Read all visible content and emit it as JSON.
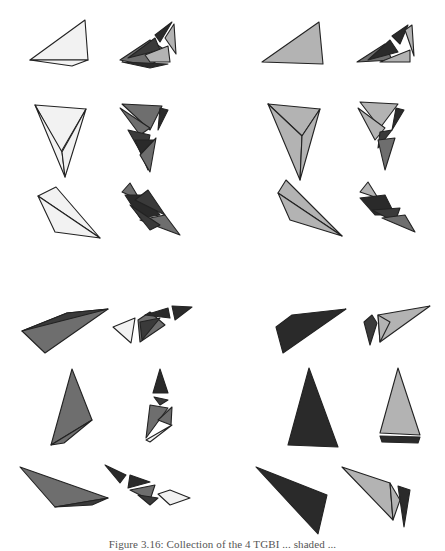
{
  "caption": "Figure 3.16: Collection of the 4 TGBI ... shaded ...",
  "colors": {
    "white_fill": "#f2f2f2",
    "light_gray": "#b3b3b3",
    "mid_gray": "#6e6e6e",
    "dark_gray": "#3a3a3a",
    "darkest": "#2a2a2a",
    "stroke": "#222222"
  },
  "panels": [
    {
      "name": "top-left-light",
      "label": "upper-left panel: white complete shapes with dark fragments"
    },
    {
      "name": "top-right-gray",
      "label": "upper-right panel: gray complete shapes with dark fragments"
    },
    {
      "name": "bottom-left-mid",
      "label": "lower-left panel: mid-gray complete shapes with fragments"
    },
    {
      "name": "bottom-right-dark",
      "label": "lower-right panel: dark complete shapes with light fragments"
    }
  ],
  "shapes": [
    {
      "id": "s1",
      "fill": "white_fill",
      "pts": "30,60 85,20 88,60"
    },
    {
      "id": "s1b",
      "fill": "white_fill",
      "pts": "30,60 88,60 72,66"
    },
    {
      "id": "f1a",
      "fill": "mid_gray",
      "pts": "120,60 150,40 168,52 150,66"
    },
    {
      "id": "f1b",
      "fill": "dark_gray",
      "pts": "128,58 155,38 160,50"
    },
    {
      "id": "f1c",
      "fill": "light_gray",
      "pts": "145,55 168,46 170,62 150,62"
    },
    {
      "id": "f1d",
      "fill": "darkest",
      "pts": "155,35 172,22 160,42"
    },
    {
      "id": "f1e",
      "fill": "light_gray",
      "pts": "165,38 174,24 176,54"
    },
    {
      "id": "f1f",
      "fill": "darkest",
      "pts": "122,62 168,64 150,68"
    },
    {
      "id": "s2",
      "fill": "light_gray",
      "pts": "262,62 319,22 323,64"
    },
    {
      "id": "f2a",
      "fill": "mid_gray",
      "pts": "357,62 385,44 392,60"
    },
    {
      "id": "f2b",
      "fill": "darkest",
      "pts": "368,60 390,40 398,52"
    },
    {
      "id": "f2c",
      "fill": "darkest",
      "pts": "392,36 408,25 400,44"
    },
    {
      "id": "f2d",
      "fill": "light_gray",
      "pts": "405,30 412,25 414,56"
    },
    {
      "id": "f2e",
      "fill": "light_gray",
      "pts": "380,62 410,50 410,62"
    },
    {
      "id": "s3",
      "fill": "white_fill",
      "pts": "35,105 86,109 61,152"
    },
    {
      "id": "s3b",
      "fill": "white_fill",
      "pts": "35,105 62,152 65,177"
    },
    {
      "id": "s3c",
      "fill": "white_fill",
      "pts": "62,152 86,109 65,177"
    },
    {
      "id": "f3a",
      "fill": "mid_gray",
      "pts": "122,104 162,106 150,130"
    },
    {
      "id": "f3b",
      "fill": "mid_gray",
      "pts": "120,108 140,135 150,128"
    },
    {
      "id": "f3c",
      "fill": "darkest",
      "pts": "160,108 168,110 158,130"
    },
    {
      "id": "f3d",
      "fill": "dark_gray",
      "pts": "128,130 150,135 145,160"
    },
    {
      "id": "f3e",
      "fill": "darkest",
      "pts": "135,140 155,140 148,170"
    },
    {
      "id": "f3f",
      "fill": "mid_gray",
      "pts": "140,155 156,138 150,172"
    },
    {
      "id": "s4",
      "fill": "light_gray",
      "pts": "268,104 320,109 302,136"
    },
    {
      "id": "s4b",
      "fill": "light_gray",
      "pts": "268,104 302,136 300,180"
    },
    {
      "id": "s4c",
      "fill": "light_gray",
      "pts": "302,136 320,109 300,180"
    },
    {
      "id": "f4a",
      "fill": "light_gray",
      "pts": "360,102 398,104 380,128"
    },
    {
      "id": "f4b",
      "fill": "light_gray",
      "pts": "358,108 375,140 385,128"
    },
    {
      "id": "f4c",
      "fill": "darkest",
      "pts": "396,108 404,110 392,130"
    },
    {
      "id": "f4d",
      "fill": "dark_gray",
      "pts": "380,132 392,130 378,148"
    },
    {
      "id": "f4e",
      "fill": "mid_gray",
      "pts": "378,140 395,138 385,170"
    },
    {
      "id": "s5",
      "fill": "white_fill",
      "pts": "38,196 56,187 100,238"
    },
    {
      "id": "s5b",
      "fill": "white_fill",
      "pts": "38,196 55,232 100,238"
    },
    {
      "id": "f5a",
      "fill": "mid_gray",
      "pts": "122,192 130,183 140,200"
    },
    {
      "id": "f5b",
      "fill": "darkest",
      "pts": "125,195 145,195 160,215 140,218"
    },
    {
      "id": "f5c",
      "fill": "dark_gray",
      "pts": "135,200 148,190 165,215"
    },
    {
      "id": "f5d",
      "fill": "mid_gray",
      "pts": "140,220 165,215 180,235"
    },
    {
      "id": "f5e",
      "fill": "dark_gray",
      "pts": "130,205 160,225 150,230"
    },
    {
      "id": "s6",
      "fill": "light_gray",
      "pts": "278,193 286,180 342,236"
    },
    {
      "id": "s6b",
      "fill": "light_gray",
      "pts": "278,193 290,220 342,236"
    },
    {
      "id": "f6a",
      "fill": "light_gray",
      "pts": "360,192 368,182 378,198"
    },
    {
      "id": "f6b",
      "fill": "darkest",
      "pts": "360,198 385,195 395,215 375,215"
    },
    {
      "id": "f6c",
      "fill": "dark_gray",
      "pts": "372,210 400,208 395,222"
    },
    {
      "id": "f6d",
      "fill": "mid_gray",
      "pts": "382,218 405,215 415,232"
    },
    {
      "id": "s7",
      "fill": "mid_gray",
      "pts": "22,331 67,313 108,309 45,353"
    },
    {
      "id": "s7b",
      "fill": "dark_gray",
      "pts": "22,331 67,313 108,309"
    },
    {
      "id": "f7a",
      "fill": "white_fill",
      "pts": "113,327 135,318 131,343"
    },
    {
      "id": "f7b",
      "fill": "mid_gray",
      "pts": "138,320 150,312 165,325 140,342"
    },
    {
      "id": "f7c",
      "fill": "darkest",
      "pts": "145,315 168,308 170,318"
    },
    {
      "id": "f7d",
      "fill": "darkest",
      "pts": "172,306 192,307 175,320"
    },
    {
      "id": "f7e",
      "fill": "dark_gray",
      "pts": "140,322 160,318 142,340"
    },
    {
      "id": "s8",
      "fill": "darkest",
      "pts": "276,327 292,315 346,309 283,353"
    },
    {
      "id": "f8a",
      "fill": "dark_gray",
      "pts": "364,322 372,315 377,323 370,345"
    },
    {
      "id": "f8b",
      "fill": "light_gray",
      "pts": "378,315 430,306 380,342"
    },
    {
      "id": "f8c",
      "fill": "light_gray",
      "pts": "378,315 390,322 380,342"
    },
    {
      "id": "s9",
      "fill": "mid_gray",
      "pts": "72,369 92,420 51,445"
    },
    {
      "id": "s9b",
      "fill": "mid_gray",
      "pts": "51,445 92,420 64,443"
    },
    {
      "id": "f9a",
      "fill": "darkest",
      "pts": "160,369 168,393 153,393"
    },
    {
      "id": "f9b",
      "fill": "dark_gray",
      "pts": "154,397 168,400 160,405"
    },
    {
      "id": "f9c",
      "fill": "mid_gray",
      "pts": "150,405 168,408 146,438"
    },
    {
      "id": "f9d",
      "fill": "mid_gray",
      "pts": "158,420 172,407 171,425"
    },
    {
      "id": "f9e",
      "fill": "white_fill",
      "pts": "146,440 172,425 150,442"
    },
    {
      "id": "s10",
      "fill": "darkest",
      "pts": "309,368 338,447 288,445"
    },
    {
      "id": "f10a",
      "fill": "light_gray",
      "pts": "398,368 420,435 380,433"
    },
    {
      "id": "f10b",
      "fill": "darkest",
      "pts": "380,436 420,437 418,443 382,442"
    },
    {
      "id": "s11",
      "fill": "mid_gray",
      "pts": "20,467 108,498 55,507"
    },
    {
      "id": "s11b",
      "fill": "dark_gray",
      "pts": "55,507 108,498 92,505"
    },
    {
      "id": "f11a",
      "fill": "darkest",
      "pts": "105,465 126,475 120,483"
    },
    {
      "id": "f11b",
      "fill": "darkest",
      "pts": "130,475 150,482 128,488"
    },
    {
      "id": "f11c",
      "fill": "mid_gray",
      "pts": "130,490 155,485 150,500"
    },
    {
      "id": "f11d",
      "fill": "dark_gray",
      "pts": "138,495 158,498 150,505"
    },
    {
      "id": "f11e",
      "fill": "white_fill",
      "pts": "158,494 170,490 190,498 170,505"
    },
    {
      "id": "s12",
      "fill": "darkest",
      "pts": "256,467 327,495 318,534"
    },
    {
      "id": "f12a",
      "fill": "light_gray",
      "pts": "342,467 390,483 393,520"
    },
    {
      "id": "f12b",
      "fill": "light_gray",
      "pts": "390,483 400,500 393,520"
    },
    {
      "id": "f12c",
      "fill": "darkest",
      "pts": "398,486 410,490 404,527"
    }
  ]
}
